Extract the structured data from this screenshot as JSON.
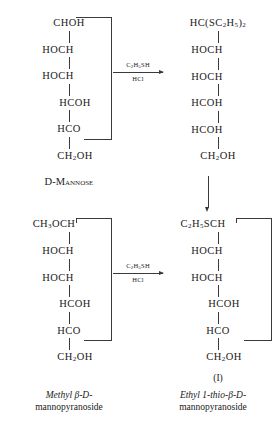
{
  "diagram": {
    "reagent_above": "C2H5SH",
    "reagent_below": "HCl",
    "bond_color": "#3a3a3a",
    "background": "#ffffff"
  },
  "structures": {
    "top_left": {
      "name": "d-mannose",
      "residues": [
        "CHOH",
        "HOCH",
        "HOCH",
        "HCOH",
        "HCO",
        "CH2OH"
      ],
      "caption_line1": "D-Mannose",
      "caption_line2": ""
    },
    "top_right": {
      "name": "mannose-diethyl-dithioacetal",
      "residues": [
        "HC(SC2H5)2",
        "HOCH",
        "HOCH",
        "HCOH",
        "HCOH",
        "CH2OH"
      ],
      "caption_line1": "",
      "caption_line2": ""
    },
    "bottom_left": {
      "name": "methyl-beta-d-mannopyranoside",
      "residues": [
        "CH3OCH",
        "HOCH",
        "HOCH",
        "HCOH",
        "HCO",
        "CH2OH"
      ],
      "caption_line1": "Methyl β-D-",
      "caption_line2": "mannopyranoside"
    },
    "bottom_right": {
      "name": "ethyl-1-thio-beta-d-mannopyranoside",
      "residues": [
        "C2H5SCH",
        "HOCH",
        "HOCH",
        "HCOH",
        "HCO",
        "CH2OH"
      ],
      "roman_label": "(I)",
      "caption_line1": "Ethyl 1-thio-β-D-",
      "caption_line2": "mannopyranoside"
    }
  },
  "arrows": {
    "top_horizontal": {
      "above": "C2H5SH",
      "below": "HCl"
    },
    "bottom_horizontal": {
      "above": "C2H5SH",
      "below": "HCl"
    },
    "right_vertical": {
      "label": ""
    }
  }
}
